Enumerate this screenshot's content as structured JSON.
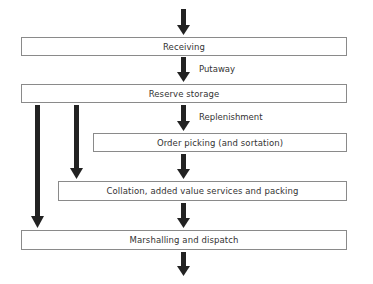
{
  "diagram": {
    "type": "warehouse-process-flow",
    "colors": {
      "arrow": "#222222",
      "box_border": "#8a8a8a",
      "text": "#333333"
    },
    "boxes": [
      {
        "id": "receiving",
        "label": "Receiving"
      },
      {
        "id": "reserve-storage",
        "label": "Reserve storage"
      },
      {
        "id": "order-picking",
        "label": "Order picking (and sortation)"
      },
      {
        "id": "collation",
        "label": "Collation, added value services and packing"
      },
      {
        "id": "marshalling",
        "label": "Marshalling and dispatch"
      }
    ],
    "arrow_labels": {
      "putaway": "Putaway",
      "replenishment": "Replenishment"
    },
    "connections": [
      {
        "from": "input",
        "to": "receiving",
        "label": ""
      },
      {
        "from": "receiving",
        "to": "reserve-storage",
        "label": "Putaway"
      },
      {
        "from": "reserve-storage",
        "to": "order-picking",
        "label": "Replenishment"
      },
      {
        "from": "order-picking",
        "to": "collation",
        "label": ""
      },
      {
        "from": "collation",
        "to": "marshalling",
        "label": ""
      },
      {
        "from": "marshalling",
        "to": "output",
        "label": ""
      },
      {
        "from": "reserve-storage",
        "to": "collation",
        "label": ""
      },
      {
        "from": "reserve-storage",
        "to": "marshalling",
        "label": ""
      }
    ]
  }
}
